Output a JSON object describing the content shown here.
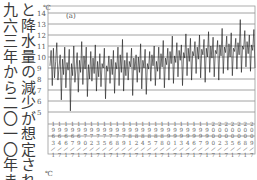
{
  "text": {
    "col_right": "と降水量の減少が想定されるが、",
    "col_left": "九六三年から二〇一〇年までの"
  },
  "chart_data": {
    "type": "line",
    "title": "(a)",
    "xlabel": "",
    "ylabel": "℃",
    "bottom_unit": "℃",
    "ylim": [
      5,
      14
    ],
    "yticks": [
      5,
      6,
      7,
      8,
      9,
      10,
      11,
      12,
      13,
      14
    ],
    "grid": true,
    "xlim": [
      "1963/1",
      "2010/12"
    ],
    "xtick_labels": [
      "1963/1",
      "1964/7",
      "1966/1",
      "1967/7",
      "1969/1",
      "1970/7",
      "1972/1",
      "1973/7",
      "1975/1",
      "1976/7",
      "1978/1",
      "1979/7",
      "1981/1",
      "1982/7",
      "1984/1",
      "1985/7",
      "1987/1",
      "1988/7",
      "1990/1",
      "1991/7",
      "1993/1",
      "1994/7",
      "1996/1",
      "1997/7",
      "1999/1",
      "2000/7",
      "2002/1",
      "2003/7",
      "2005/1",
      "2006/7",
      "2008/1",
      "2009/7"
    ],
    "series": [
      {
        "name": "temperature",
        "values": [
          9.2,
          10.6,
          7.4,
          10.8,
          8.1,
          9.6,
          11.3,
          7.9,
          9.1,
          10.2,
          6.1,
          9.8,
          8.4,
          10.9,
          7.2,
          9.5,
          8.8,
          10.7,
          5.1,
          9.4,
          8.3,
          11.0,
          7.7,
          9.0,
          10.4,
          6.8,
          9.7,
          8.6,
          11.4,
          7.5,
          10.1,
          8.9,
          10.9,
          6.4,
          9.3,
          8.0,
          10.5,
          7.8,
          9.9,
          8.5,
          11.1,
          6.9,
          9.6,
          8.2,
          10.3,
          7.3,
          9.4,
          9.0,
          10.8,
          6.2,
          9.2,
          8.7,
          10.1,
          7.6,
          9.8,
          8.4,
          10.6,
          6.7,
          9.5,
          8.9,
          10.9,
          7.4,
          10.2,
          8.6,
          11.6,
          6.9,
          9.7,
          8.3,
          10.4,
          7.9,
          9.6,
          9.1,
          10.8,
          6.5,
          9.9,
          8.8,
          10.2,
          7.7,
          10.0,
          8.6,
          11.2,
          7.1,
          9.7,
          9.0,
          10.7,
          6.6,
          9.4,
          8.9,
          10.5,
          7.8,
          10.2,
          9.2,
          11.0,
          7.4,
          9.6,
          8.7,
          10.9,
          8.0,
          10.3,
          9.1,
          11.5,
          7.2,
          9.9,
          9.3,
          10.8,
          7.9,
          10.5,
          9.4,
          11.9,
          7.6,
          10.1,
          9.5,
          11.3,
          8.2,
          10.6,
          9.7,
          11.1,
          7.4,
          10.4,
          9.9,
          12.1,
          8.3,
          10.8,
          9.6,
          11.7,
          7.9,
          10.5,
          10.1,
          11.4,
          8.5,
          10.9,
          9.8,
          12.0,
          8.1,
          10.7,
          10.2,
          11.6,
          7.7,
          10.8,
          10.0,
          12.3,
          8.6,
          11.0,
          9.9,
          11.8,
          8.2,
          10.6,
          10.3,
          11.5,
          7.9,
          11.1,
          10.1,
          12.6,
          8.5,
          10.9,
          10.4,
          11.9,
          8.8,
          11.2,
          10.0,
          12.2,
          8.3,
          10.8,
          10.5,
          11.7,
          8.9,
          11.3,
          10.2,
          13.4,
          8.6,
          11.0,
          10.7,
          12.4,
          9.1,
          11.4,
          10.3,
          12.0,
          8.7,
          11.1,
          10.6,
          12.5,
          9.0
        ]
      }
    ]
  }
}
